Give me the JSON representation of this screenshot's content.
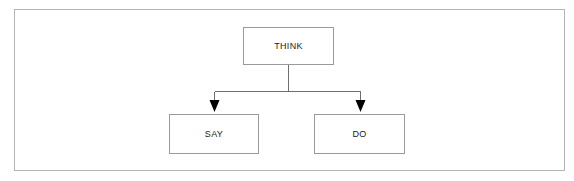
{
  "diagram": {
    "background_color": "#ffffff",
    "frame": {
      "border_color": "#b4b4b4"
    },
    "node_style": {
      "border_color": "#9a9a9a",
      "fill_color": "#ffffff",
      "text_color": "#1a1a1a"
    },
    "connector_style": {
      "line_color": "#6e6e6e",
      "arrow_color": "#000000"
    },
    "nodes": [
      {
        "id": "think",
        "label": "THINK",
        "role": "root"
      },
      {
        "id": "say",
        "label": "SAY",
        "role": "child"
      },
      {
        "id": "do",
        "label": "DO",
        "role": "child"
      }
    ],
    "edges": [
      {
        "from": "think",
        "to": "say",
        "arrow": "down-arrowhead"
      },
      {
        "from": "think",
        "to": "do",
        "arrow": "down-arrowhead"
      }
    ]
  }
}
